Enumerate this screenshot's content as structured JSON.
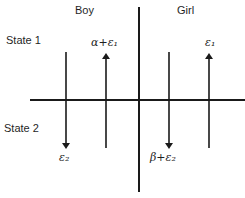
{
  "diagram": {
    "columns": {
      "left": "Boy",
      "right": "Girl"
    },
    "rows": {
      "top": "State 1",
      "bottom": "State 2"
    },
    "arrows": [
      {
        "group": "Boy",
        "direction": "down",
        "label": "ε₂"
      },
      {
        "group": "Boy",
        "direction": "up",
        "label": "α+ε₁"
      },
      {
        "group": "Girl",
        "direction": "down",
        "label": "β+ε₂"
      },
      {
        "group": "Girl",
        "direction": "up",
        "label": "ε₁"
      }
    ],
    "line_color": "#1a1a1a"
  }
}
